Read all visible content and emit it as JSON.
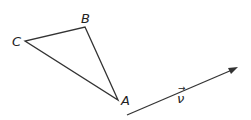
{
  "diagram": {
    "triangle": {
      "vertices": [
        {
          "label": "A",
          "x": 118,
          "y": 100
        },
        {
          "label": "B",
          "x": 85,
          "y": 27
        },
        {
          "label": "C",
          "x": 25,
          "y": 41
        }
      ]
    },
    "vector": {
      "label": "ν",
      "arrow": "→",
      "start": {
        "x": 127,
        "y": 115
      },
      "end": {
        "x": 237,
        "y": 68
      }
    },
    "colors": {
      "stroke": "#333333",
      "text": "#222222"
    }
  }
}
